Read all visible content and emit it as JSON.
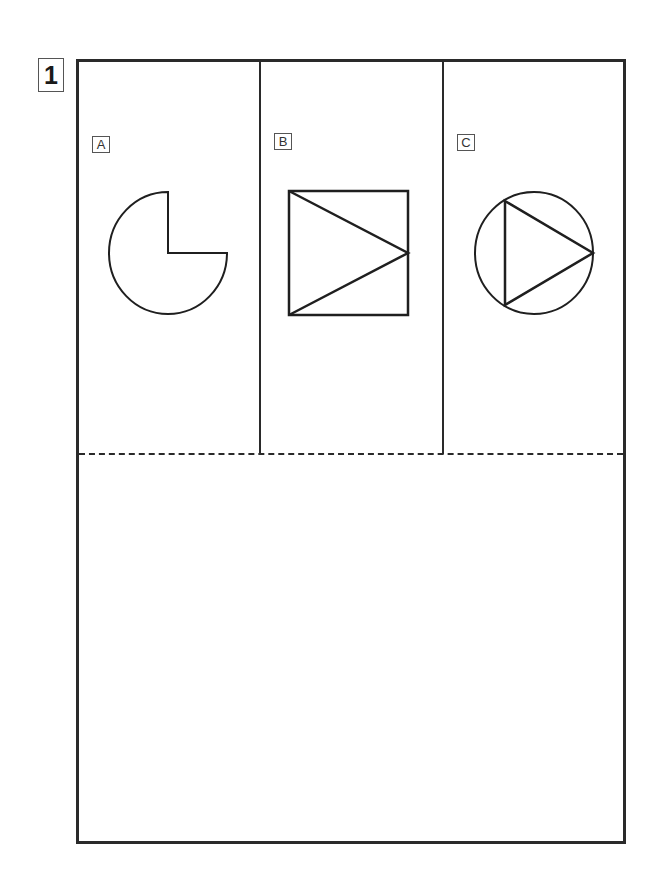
{
  "question": {
    "number": "1"
  },
  "panels": [
    {
      "label": "A",
      "figure": "circle-with-quarter-removed"
    },
    {
      "label": "B",
      "figure": "square-with-inscribed-triangle"
    },
    {
      "label": "C",
      "figure": "circle-with-inscribed-triangle"
    }
  ],
  "answer_area": {
    "text": ""
  }
}
